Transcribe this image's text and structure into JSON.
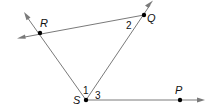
{
  "diagram": {
    "type": "geometry-angles",
    "points": [
      {
        "id": "R",
        "label": "R"
      },
      {
        "id": "Q",
        "label": "Q"
      },
      {
        "id": "S",
        "label": "S"
      },
      {
        "id": "P",
        "label": "P"
      }
    ],
    "lines": [
      {
        "id": "line-RQ",
        "through": [
          "R",
          "Q"
        ],
        "kind": "line"
      },
      {
        "id": "ray-SR",
        "from": "S",
        "through": "R",
        "kind": "ray"
      },
      {
        "id": "ray-SQ",
        "from": "S",
        "through": "Q",
        "kind": "ray"
      },
      {
        "id": "ray-SP",
        "from": "S",
        "through": "P",
        "kind": "ray"
      }
    ],
    "angles": [
      {
        "label": "1",
        "vertex": "S",
        "between": [
          "R",
          "Q"
        ]
      },
      {
        "label": "2",
        "vertex": "Q",
        "between": [
          "R",
          "S"
        ]
      },
      {
        "label": "3",
        "vertex": "S",
        "between": [
          "Q",
          "P"
        ]
      }
    ],
    "colors": {
      "line": "#7a7a7a",
      "point": "#000000",
      "text": "#111111"
    }
  }
}
